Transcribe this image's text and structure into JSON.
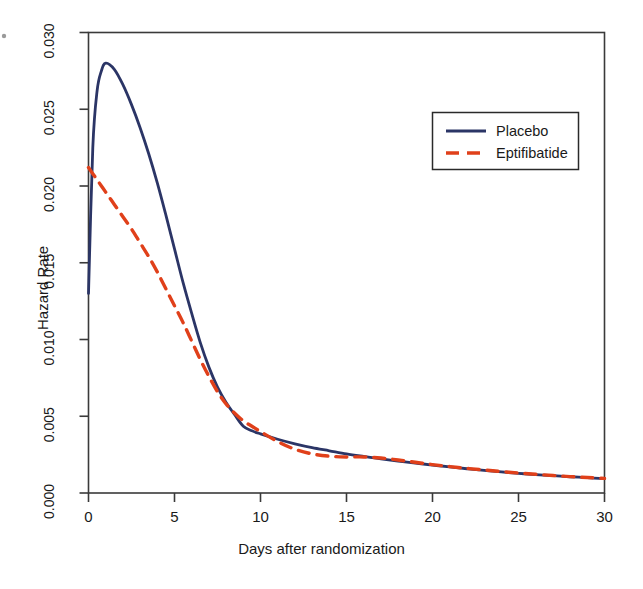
{
  "chart_data": {
    "type": "line",
    "title": "",
    "xlabel": "Days after randomization",
    "ylabel": "Hazard Rate",
    "xlim": [
      0,
      30
    ],
    "ylim": [
      0.0,
      0.03
    ],
    "xticks": [
      "0",
      "5",
      "10",
      "15",
      "20",
      "25",
      "30"
    ],
    "xtick_values": [
      0,
      5,
      10,
      15,
      20,
      25,
      30
    ],
    "yticks": [
      "0.000",
      "0.005",
      "0.010",
      "0.015",
      "0.020",
      "0.025",
      "0.030"
    ],
    "ytick_values": [
      0.0,
      0.005,
      0.01,
      0.015,
      0.02,
      0.025,
      0.03
    ],
    "grid": false,
    "legend_position": "top-right",
    "x": [
      0,
      0.25,
      0.5,
      0.75,
      1,
      1.5,
      2,
      2.5,
      3,
      3.5,
      4,
      4.5,
      5,
      5.5,
      6,
      6.5,
      7,
      7.5,
      8,
      8.5,
      9,
      9.5,
      10,
      11,
      12,
      13,
      14,
      15,
      16,
      17,
      18,
      19,
      20,
      21,
      22,
      23,
      24,
      25,
      26,
      27,
      28,
      29,
      30
    ],
    "series": [
      {
        "name": "Placebo",
        "color": "#2b3566",
        "style": "solid",
        "values": [
          0.013,
          0.0225,
          0.0262,
          0.0275,
          0.028,
          0.0276,
          0.0266,
          0.0253,
          0.0238,
          0.0221,
          0.0202,
          0.0181,
          0.0159,
          0.0137,
          0.0117,
          0.0098,
          0.0082,
          0.0069,
          0.0059,
          0.0051,
          0.00435,
          0.00405,
          0.00385,
          0.0035,
          0.0032,
          0.00295,
          0.00275,
          0.00255,
          0.00238,
          0.00222,
          0.00208,
          0.00195,
          0.00182,
          0.0017,
          0.00158,
          0.00148,
          0.00138,
          0.00128,
          0.0012,
          0.00113,
          0.00106,
          0.001,
          0.00093
        ]
      },
      {
        "name": "Eptifibatide",
        "color": "#e0401a",
        "style": "dashed",
        "values": [
          0.0212,
          0.0208,
          0.0204,
          0.02,
          0.0196,
          0.0188,
          0.018,
          0.0172,
          0.0163,
          0.0154,
          0.0144,
          0.0133,
          0.0122,
          0.0111,
          0.0099,
          0.0087,
          0.0076,
          0.0066,
          0.0058,
          0.0052,
          0.0047,
          0.00435,
          0.004,
          0.00335,
          0.00285,
          0.00255,
          0.0024,
          0.00235,
          0.00235,
          0.00228,
          0.00215,
          0.002,
          0.00185,
          0.00172,
          0.0016,
          0.0015,
          0.0014,
          0.0013,
          0.00122,
          0.00114,
          0.00107,
          0.00101,
          0.00095
        ]
      }
    ]
  },
  "legend": {
    "items": [
      {
        "label": "Placebo",
        "color": "#2b3566",
        "style": "solid"
      },
      {
        "label": "Eptifibatide",
        "color": "#e0401a",
        "style": "dashed"
      }
    ]
  },
  "axes": {
    "y_title": "Hazard Rate",
    "x_title": "Days after randomization"
  },
  "colors": {
    "placebo": "#2b3566",
    "eptifibatide": "#e0401a",
    "axis": "#3a3a3a",
    "text": "#1a1a1a",
    "background": "#ffffff"
  }
}
